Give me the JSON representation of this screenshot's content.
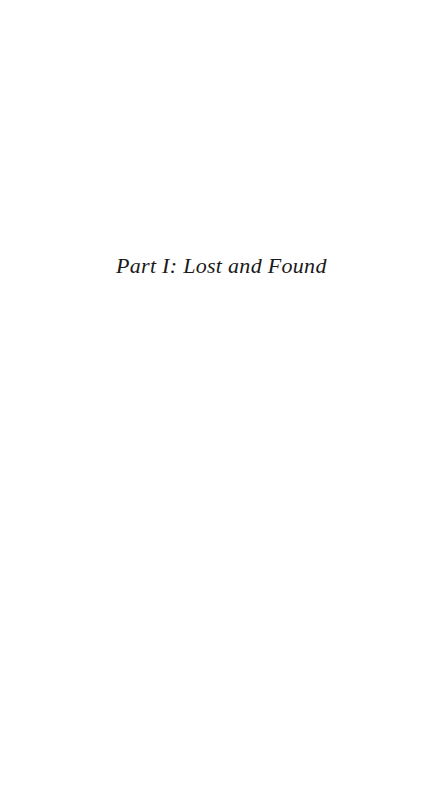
{
  "page": {
    "background_color": "#ffffff",
    "width": 434,
    "height": 797,
    "kind": "part-title-page"
  },
  "heading": {
    "text": "Part I: Lost and Found",
    "part_label": "Part I",
    "part_name": "Lost and Found",
    "color": "#1a1a1a",
    "style": "italic-serif",
    "alignment": "left"
  },
  "footer": {
    "page_number": ""
  }
}
